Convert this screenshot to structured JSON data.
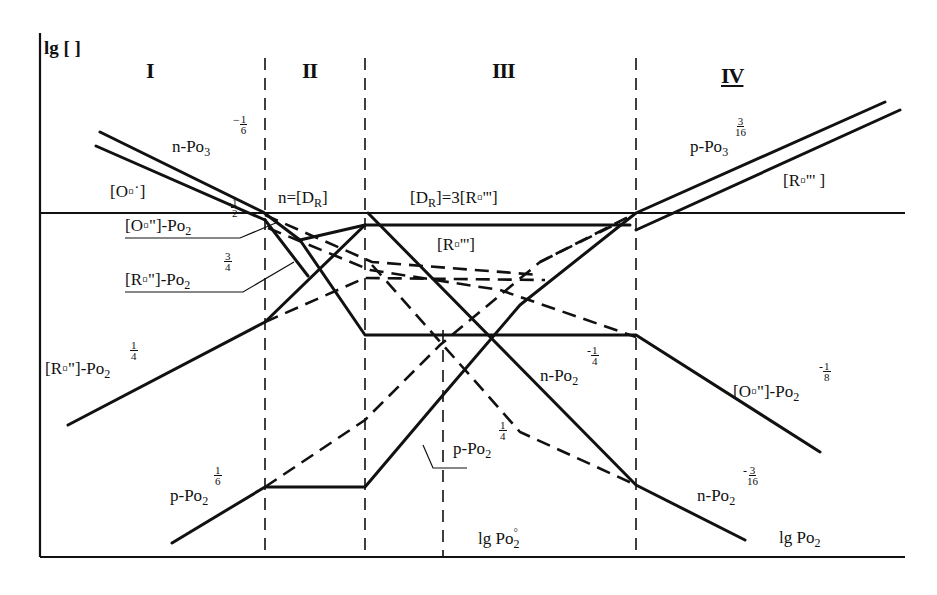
{
  "figure": {
    "y_axis_label": "lg [ ]",
    "x_axis_label": "lg Po",
    "x_axis_label_sub": "2",
    "x_reference_label": "lg Po",
    "x_reference_label_sub": "2",
    "x_reference_label_sup": "°"
  },
  "regions": [
    {
      "id": "I",
      "label": "I"
    },
    {
      "id": "II",
      "label": "II"
    },
    {
      "id": "III",
      "label": "III"
    },
    {
      "id": "IV",
      "label": "IV"
    }
  ],
  "boundary_labels": {
    "region_II": "n=[ḊR]",
    "region_II_main": "n=[D",
    "region_II_sub": "R",
    "region_II_close": "]",
    "region_III_main": "[D",
    "region_III_sub": "R",
    "region_III_rest": "]=3[R▫''']"
  },
  "curve_labels": {
    "n_po3_region1": {
      "text": "n-Po",
      "sub": "3",
      "neg": "−",
      "num": "1",
      "den": "6"
    },
    "o_vac_single": {
      "text": "[O▫˙]"
    },
    "o_vac_double_region2": {
      "text": "[O▫\"]-Po",
      "sub": "2",
      "neg": "-",
      "num": "1",
      "den": "2"
    },
    "r_vac_double_3_4": {
      "text": "[R▫\"]-Po",
      "sub": "2",
      "num": "3",
      "den": "4"
    },
    "r_vac_double_1_4": {
      "text": "[R▫\"]-Po",
      "sub": "2",
      "num": "1",
      "den": "4"
    },
    "r_vac_triple_plateau": {
      "text": "[R▫''']"
    },
    "p_po3_region4": {
      "text": "p-Po",
      "sub": "3",
      "num": "3",
      "den": "16"
    },
    "r_vac_triple_region4": {
      "text": "[R▫''' ]"
    },
    "n_po2_neg_1_4": {
      "text": "n-Po",
      "sub": "2",
      "neg": "-",
      "num": "1",
      "den": "4"
    },
    "o_vac_double_neg_1_8": {
      "text": "[O▫\"]-Po",
      "sub": "2",
      "neg": "-",
      "num": "1",
      "den": "8"
    },
    "p_po2_1_4": {
      "text": "p-Po",
      "sub": "2",
      "num": "1",
      "den": "4"
    },
    "p_po2_1_6": {
      "text": "p-Po",
      "sub": "2",
      "num": "1",
      "den": "6"
    },
    "n_po2_neg_3_16": {
      "text": "n-Po",
      "sub": "2",
      "neg": "-",
      "num": "3",
      "den": "16"
    }
  },
  "chart_data": {
    "type": "line",
    "xlabel": "lg Po2",
    "ylabel": "lg [ ]",
    "reference_x_label": "lg Po2°",
    "regions": [
      "I",
      "II",
      "III",
      "IV"
    ],
    "slopes": [
      {
        "species": "n",
        "region": "I",
        "dependence": "Po3^(-1/6)"
      },
      {
        "species": "[O▫˙]",
        "region": "I",
        "dependence": "parallel to n"
      },
      {
        "species": "[O▫\"]",
        "region": "II",
        "dependence": "Po2^(-1/2)"
      },
      {
        "species": "[R▫\"]",
        "region": "II",
        "dependence": "Po2^(3/4)"
      },
      {
        "species": "[R▫\"]",
        "region": "I",
        "dependence": "Po2^(1/4)"
      },
      {
        "species": "p",
        "region": "I",
        "dependence": "Po2^(1/6)"
      },
      {
        "species": "[R▫''']",
        "region": "III",
        "dependence": "constant"
      },
      {
        "species": "n",
        "region": "III",
        "dependence": "Po2^(-1/4)"
      },
      {
        "species": "p",
        "region": "III",
        "dependence": "Po2^(1/4)"
      },
      {
        "species": "[O▫\"]",
        "region": "IV",
        "dependence": "Po2^(-1/8)"
      },
      {
        "species": "n",
        "region": "IV",
        "dependence": "Po2^(-3/16)"
      },
      {
        "species": "p",
        "region": "IV",
        "dependence": "Po3^(3/16)"
      },
      {
        "species": "[R▫''']",
        "region": "IV",
        "dependence": "parallel to p"
      }
    ],
    "electroneutrality": {
      "II": "n=[ḊR]",
      "III": "[ḊR]=3[R▫''']"
    },
    "grid": false,
    "legend": "none (inline labels)"
  },
  "geometry": {
    "axis": {
      "x0": 40,
      "y0": 557,
      "x1": 905,
      "ytop": 33
    },
    "region_boundaries_x": [
      265,
      365,
      636
    ],
    "reference_x": 443,
    "horizontal_ref_y": 213,
    "solid_paths": [
      {
        "id": "n-region1-upper",
        "d": "M100,132 L263,212 L300,240 L365,335 L636,335 L820,452"
      },
      {
        "id": "oxvac-region1-lower",
        "d": "M96,146 L265,220"
      },
      {
        "id": "r2-region1",
        "d": "M68,425 L265,322 L365,225 L630,225"
      },
      {
        "id": "n-diag-region3",
        "d": "M368,213 L636,485 L745,540"
      },
      {
        "id": "p-region",
        "d": "M172,543 L265,487 L365,487 L443,395 L520,305 L636,213 L885,102"
      },
      {
        "id": "r3-region4",
        "d": "M636,230 L900,110"
      },
      {
        "id": "p-region3-rise",
        "d": "M300,240 L365,225"
      },
      {
        "id": "n-region1-cross",
        "d": "M265,220 L308,276"
      }
    ],
    "dashed_paths": [
      {
        "id": "o2-dash-upper",
        "d": "M265,215 L372,262 L540,275"
      },
      {
        "id": "o2-dash-lower",
        "d": "M268,228 L370,270 L500,290 L636,337"
      },
      {
        "id": "r2-dash",
        "d": "M265,322 L365,278 L545,280"
      },
      {
        "id": "p-dash-region1",
        "d": "M265,487 L365,420 L440,345 L540,262 L636,213"
      },
      {
        "id": "n-dash-region3",
        "d": "M372,265 L443,345 L520,432 L636,485"
      },
      {
        "id": "p-dash-upper",
        "d": "M540,262 L620,222"
      }
    ],
    "leader_lines": [
      {
        "d": "M125,238 L240,238 L278,222"
      },
      {
        "d": "M125,292 L243,292 L294,262"
      },
      {
        "d": "M467,468 L433,468 L423,445"
      }
    ]
  }
}
